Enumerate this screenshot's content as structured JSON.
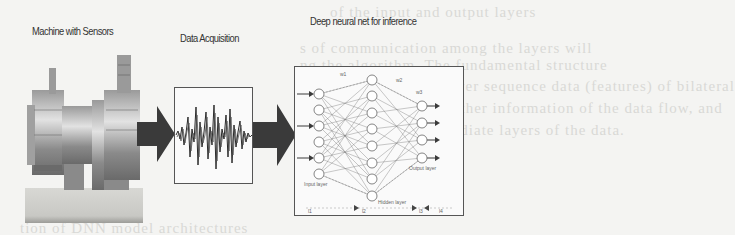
{
  "diagram": {
    "stages": [
      {
        "id": "machine",
        "label": "Machine with Sensors"
      },
      {
        "id": "acquisition",
        "label": "Data Acquisition"
      },
      {
        "id": "inference",
        "label": "Deep neural net for inference"
      }
    ],
    "neural_net": {
      "layers": [
        {
          "name": "Input layer",
          "nodes": 6
        },
        {
          "name": "Hidden layer",
          "nodes": 8
        },
        {
          "name": "Output layer",
          "nodes": 4
        }
      ],
      "weight_labels": [
        "w1",
        "w2",
        "w3"
      ],
      "axis_labels": [
        "l1",
        "l2",
        "l3",
        "l4"
      ]
    },
    "colors": {
      "arrow": "#3a3a3a",
      "frame": "#555555",
      "background": "#f4f4f2",
      "signal": "#2a2a2a"
    }
  },
  "background_bleed": [
    "of the input and output layers",
    "s of communication among the layers will",
    "ng the algorithm. The fundamental structure",
    "lower sequence data (features) of bilateral",
    "further information of the data flow, and",
    "mediate layers of the data.",
    "tion of DNN model architectures"
  ]
}
